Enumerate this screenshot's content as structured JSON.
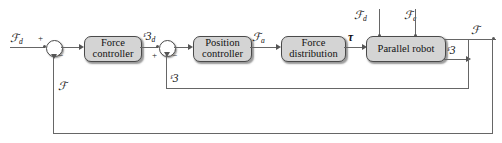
{
  "diagram": {
    "blocks": [
      {
        "id": "force_controller",
        "line1": "Force",
        "line2": "controller"
      },
      {
        "id": "position_controller",
        "line1": "Position",
        "line2": "controller"
      },
      {
        "id": "force_distribution",
        "line1": "Force",
        "line2": "distribution"
      },
      {
        "id": "parallel_robot",
        "line1": "Parallel robot",
        "line2": ""
      }
    ],
    "signals": {
      "reference_force": {
        "base": "ℱ",
        "sub": "d"
      },
      "desired_pose": {
        "base": "ᵋ3",
        "sub": "d"
      },
      "actuation_force": {
        "base": "ℱ",
        "sub": "a"
      },
      "joint_torque": {
        "base": "τ",
        "sub": ""
      },
      "disturbance_force": {
        "base": "ℱ",
        "sub": "d"
      },
      "external_force": {
        "base": "ℱ",
        "sub": "e"
      },
      "output_force": {
        "base": "ℱ",
        "sub": ""
      },
      "output_pose": {
        "base": "ᵋ3",
        "sub": ""
      },
      "force_feedback": {
        "base": "ℱ",
        "sub": ""
      },
      "pose_feedback": {
        "base": "ᵋ3",
        "sub": ""
      }
    },
    "sum_junctions": [
      {
        "id": "force-error-junction",
        "plus": "+",
        "minus": "−"
      },
      {
        "id": "position-error-junction",
        "plus": "+",
        "minus": "−"
      }
    ]
  }
}
